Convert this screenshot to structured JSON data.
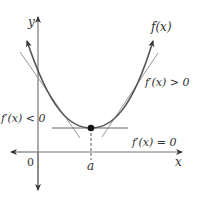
{
  "diagram": {
    "title": "",
    "axes": {
      "x_label": "x",
      "y_label": "y",
      "origin_label": "0",
      "min_point_label": "a"
    },
    "curve_label": "f(x)",
    "annotations": {
      "increasing": "f′(x) > 0",
      "decreasing": "f′(x) < 0",
      "critical": "f′(x) = 0"
    },
    "colors": {
      "axis": "#555555",
      "curve": "#555555",
      "tangent": "#888888",
      "point": "#111111",
      "text": "#333333"
    }
  }
}
